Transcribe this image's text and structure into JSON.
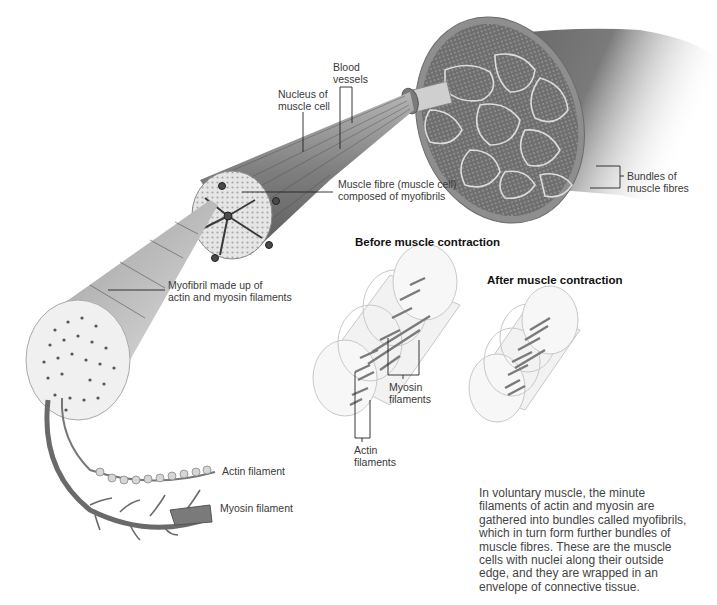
{
  "diagram": {
    "labels": {
      "blood_vessels": [
        "Blood",
        "vessels"
      ],
      "nucleus": [
        "Nucleus of",
        "muscle cell"
      ],
      "muscle_fibre": [
        "Muscle fibre (muscle cell)",
        "composed of myofibrils"
      ],
      "bundles": [
        "Bundles of",
        "muscle fibres"
      ],
      "myofibril": [
        "Myofibril made up of",
        "actin and myosin filaments"
      ],
      "actin_filament": "Actin filament",
      "myosin_filament": "Myosin filament",
      "myosin_filaments_contraction": [
        "Myosin",
        "filaments"
      ],
      "actin_filaments_contraction": [
        "Actin",
        "filaments"
      ]
    },
    "headings": {
      "before": "Before muscle contraction",
      "after": "After muscle contraction"
    },
    "caption_lines": [
      "In voluntary muscle, the minute",
      "filaments of actin and myosin are",
      "gathered into bundles called myofibrils,",
      "which in turn form further bundles of",
      "muscle fibres. These are the muscle",
      "cells with nuclei along their outside",
      "edge, and they are wrapped in an",
      "envelope of connective tissue."
    ],
    "colors": {
      "muscle_dark": "#5a5a5a",
      "muscle_mid": "#8a8a8a",
      "muscle_light": "#d9d9d9",
      "label_text": "#3a3a3a",
      "leader_line": "#222222"
    }
  }
}
